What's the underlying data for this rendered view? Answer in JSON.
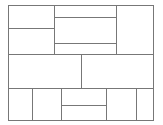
{
  "diagram": {
    "type": "rectangle-subdivision",
    "line_color": "#777777",
    "background": "#ffffff",
    "outer": {
      "x": 8,
      "y": 5,
      "w": 146,
      "h": 116
    },
    "lines": [
      {
        "id": "v-top-left",
        "x": 54,
        "y": 5,
        "w": 1,
        "h": 50
      },
      {
        "id": "v-top-right",
        "x": 116,
        "y": 5,
        "w": 1,
        "h": 50
      },
      {
        "id": "h-top-left",
        "x": 8,
        "y": 28,
        "w": 46,
        "h": 1
      },
      {
        "id": "h-top-mid-1",
        "x": 54,
        "y": 17,
        "w": 62,
        "h": 1
      },
      {
        "id": "h-top-mid-2",
        "x": 54,
        "y": 43,
        "w": 62,
        "h": 1
      },
      {
        "id": "h-row-1",
        "x": 8,
        "y": 54,
        "w": 146,
        "h": 1
      },
      {
        "id": "v-mid",
        "x": 81,
        "y": 54,
        "w": 1,
        "h": 34
      },
      {
        "id": "h-row-2",
        "x": 8,
        "y": 88,
        "w": 146,
        "h": 1
      },
      {
        "id": "v-bot-1",
        "x": 32,
        "y": 88,
        "w": 1,
        "h": 33
      },
      {
        "id": "v-bot-2",
        "x": 61,
        "y": 88,
        "w": 1,
        "h": 33
      },
      {
        "id": "v-bot-3",
        "x": 106,
        "y": 88,
        "w": 1,
        "h": 33
      },
      {
        "id": "v-bot-4",
        "x": 136,
        "y": 88,
        "w": 1,
        "h": 33
      },
      {
        "id": "h-bot-mid",
        "x": 61,
        "y": 105,
        "w": 45,
        "h": 1
      }
    ]
  }
}
